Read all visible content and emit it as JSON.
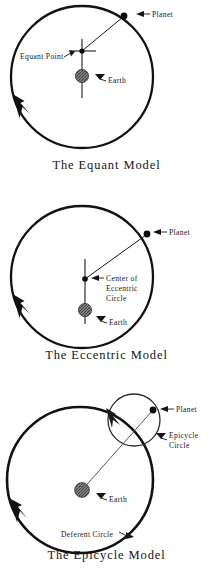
{
  "document": {
    "title": "Ptolemaic Planetary Models",
    "background_color": "#ffffff",
    "ink_color": "#111111"
  },
  "figures": [
    {
      "id": "equant",
      "caption": "The Equant Model",
      "labels": {
        "planet": "Planet",
        "equant_point": "Equant Point",
        "earth": "Earth"
      },
      "icons": {
        "planet_marker": "filled-dot",
        "earth_marker": "hatched-disc",
        "equant_marker": "crosshair-dot",
        "direction_marker": "arrowhead-counterclockwise"
      }
    },
    {
      "id": "eccentric",
      "caption": "The Eccentric Model",
      "labels": {
        "planet": "Planet",
        "center_line1": "Center of",
        "center_line2": "Eccentric",
        "center_line3": "Circle",
        "earth": "Earth"
      },
      "icons": {
        "planet_marker": "filled-dot",
        "earth_marker": "hatched-disc",
        "center_marker": "filled-dot",
        "direction_marker": "arrowhead-counterclockwise"
      }
    },
    {
      "id": "epicycle",
      "caption": "The Epicycle Model",
      "labels": {
        "planet": "Planet",
        "epicycle_line1": "Epicycle",
        "epicycle_line2": "Circle",
        "earth": "Earth",
        "deferent": "Deferent Circle"
      },
      "icons": {
        "planet_marker": "filled-dot",
        "earth_marker": "hatched-disc",
        "deferent_direction_marker": "arrowhead-counterclockwise",
        "epicycle_direction_marker": "arrowhead-counterclockwise"
      }
    }
  ]
}
